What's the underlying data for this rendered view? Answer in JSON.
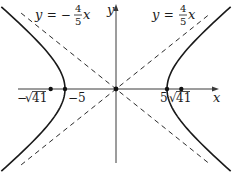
{
  "figure": {
    "width": 235,
    "height": 176,
    "origin_px": [
      116,
      89
    ],
    "scale_px_per_unit": 10.2,
    "colors": {
      "curve": "#1a1a1a",
      "axis": "#3a3a3a",
      "asymptote": "#2a2a2a",
      "point": "#111111",
      "background": "#ffffff"
    }
  },
  "hyperbola": {
    "equation": "x^2/25 - y^2/16 = 1",
    "a": 5,
    "b": 4,
    "t_max": 1.45
  },
  "axes": {
    "x_label": "x",
    "y_label": "y",
    "x_range_px": [
      18,
      219
    ],
    "y_range_px": [
      4,
      163
    ]
  },
  "asymptotes": [
    {
      "label_lhs": "y = −",
      "label_num": "4",
      "label_den": "5",
      "label_var": "x",
      "slope": -0.8,
      "x_extent": 9.3
    },
    {
      "label_lhs": "y = ",
      "label_num": "4",
      "label_den": "5",
      "label_var": "x",
      "slope": 0.8,
      "x_extent": 9.3
    }
  ],
  "points": {
    "vertices": [
      {
        "x": -5,
        "label": "−5"
      },
      {
        "x": 5,
        "label": "5"
      }
    ],
    "foci": [
      {
        "x": -6.403,
        "label": "−√41",
        "label_sqrt": "√",
        "label_radicand": "41",
        "label_sign": "−"
      },
      {
        "x": 6.403,
        "label": "√41",
        "label_sqrt": "√",
        "label_radicand": "41",
        "label_sign": ""
      }
    ],
    "center": {
      "x": 0,
      "y": 0
    }
  },
  "labels": {
    "left_asymptote": {
      "prefix": "y",
      "eq": " = −",
      "num": "4",
      "den": "5",
      "var": "x"
    },
    "right_asymptote": {
      "prefix": "y",
      "eq": " = ",
      "num": "4",
      "den": "5",
      "var": "x"
    },
    "neg_vertex": "−5",
    "pos_vertex": "5",
    "neg_focus_sign": "−",
    "neg_focus_radicand": "41",
    "pos_focus_radicand": "41",
    "sqrt_symbol": "√",
    "x_axis": "x",
    "y_axis": "y"
  }
}
